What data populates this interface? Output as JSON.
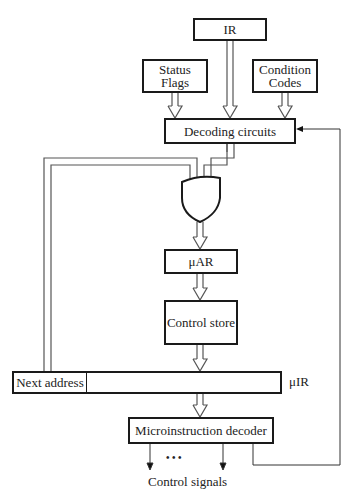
{
  "diagram": {
    "type": "microprogrammed control unit block diagram",
    "nodes": {
      "ir": {
        "label": "IR"
      },
      "status_flags": {
        "label_line1": "Status",
        "label_line2": "Flags"
      },
      "condition_codes": {
        "label_line1": "Condition",
        "label_line2": "Codes"
      },
      "decoding_circuits": {
        "label": "Decoding circuits"
      },
      "or_gate": {
        "label": ""
      },
      "uar": {
        "label": "μAR"
      },
      "control_store": {
        "label": "Control store"
      },
      "uir": {
        "label": "μIR",
        "next_address_field": "Next address"
      },
      "microinstruction_decoder": {
        "label": "Microinstruction decoder"
      }
    },
    "outputs": {
      "control_signals_label": "Control signals",
      "ellipsis": "•  •  •"
    },
    "edges": [
      {
        "from": "IR",
        "to": "Decoding circuits",
        "style": "bus"
      },
      {
        "from": "Status Flags",
        "to": "Decoding circuits",
        "style": "bus"
      },
      {
        "from": "Condition Codes",
        "to": "Decoding circuits",
        "style": "bus"
      },
      {
        "from": "Decoding circuits",
        "to": "OR gate",
        "style": "bus"
      },
      {
        "from": "Next address",
        "to": "OR gate",
        "style": "bus"
      },
      {
        "from": "OR gate",
        "to": "μAR",
        "style": "bus"
      },
      {
        "from": "μAR",
        "to": "Control store",
        "style": "bus"
      },
      {
        "from": "Control store",
        "to": "μIR",
        "style": "bus"
      },
      {
        "from": "μIR",
        "to": "Microinstruction decoder",
        "style": "bus"
      },
      {
        "from": "Microinstruction decoder",
        "to": "Decoding circuits",
        "style": "line"
      },
      {
        "from": "Microinstruction decoder",
        "to": "Control signals",
        "style": "line"
      }
    ]
  }
}
